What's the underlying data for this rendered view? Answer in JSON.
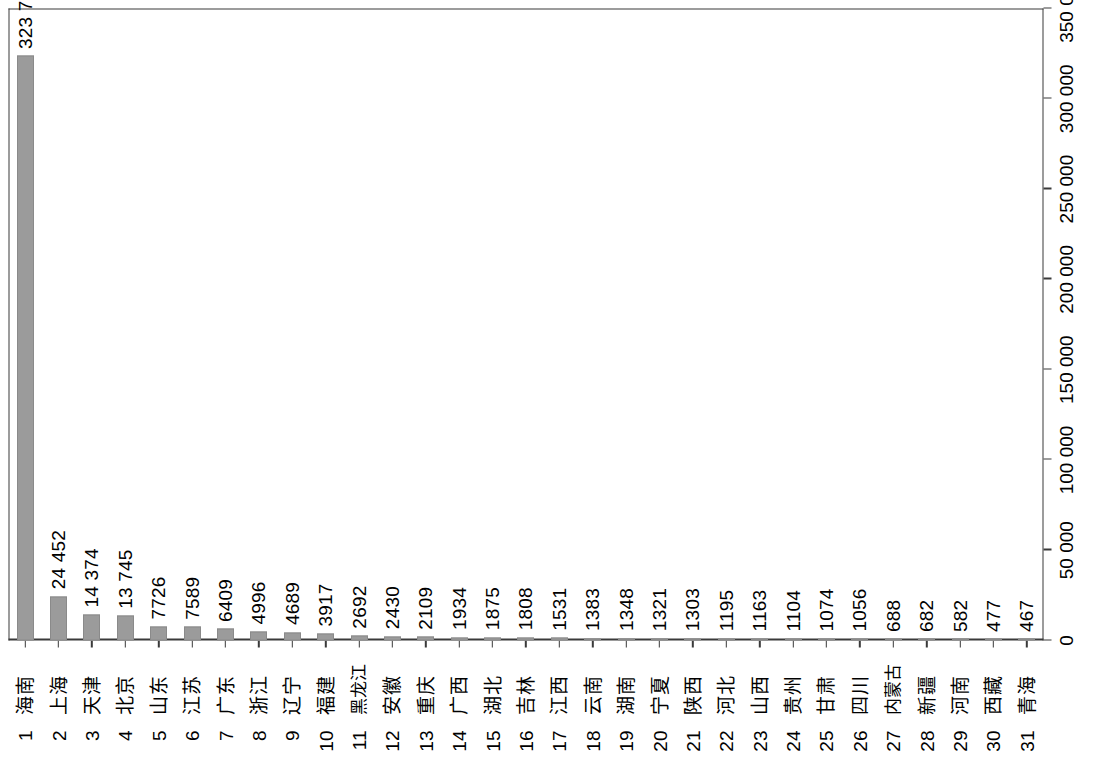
{
  "chart_data": {
    "type": "bar",
    "orientation": "horizontal",
    "title": "",
    "subtitle": "",
    "xlabel": "",
    "ylabel": "",
    "grid": false,
    "legend": null,
    "xlim": [
      0,
      350000
    ],
    "axis_tick_labels": [
      "0",
      "50 000",
      "100 000",
      "150 000",
      "200 000",
      "250 000",
      "300 000",
      "350 000"
    ],
    "axis_tick_values": [
      0,
      50000,
      100000,
      150000,
      200000,
      250000,
      300000,
      350000
    ],
    "axis_last_label_clipped": true,
    "bar_color": "#9b9b9b",
    "frame_color": "#3a3a3a",
    "ranks": [
      1,
      2,
      3,
      4,
      5,
      6,
      7,
      8,
      9,
      10,
      11,
      12,
      13,
      14,
      15,
      16,
      17,
      18,
      19,
      20,
      21,
      22,
      23,
      24,
      25,
      26,
      27,
      28,
      29,
      30,
      31
    ],
    "categories": [
      "海南",
      "上海",
      "天津",
      "北京",
      "山东",
      "江苏",
      "广东",
      "浙江",
      "辽宁",
      "福建",
      "黑龙江",
      "安徽",
      "重庆",
      "广西",
      "湖北",
      "吉林",
      "江西",
      "云南",
      "湖南",
      "宁夏",
      "陕西",
      "河北",
      "山西",
      "贵州",
      "甘肃",
      "四川",
      "内蒙古",
      "新疆",
      "河南",
      "西藏",
      "青海"
    ],
    "values": [
      323720,
      24452,
      14374,
      13745,
      7726,
      7589,
      6409,
      4996,
      4689,
      3917,
      2692,
      2430,
      2109,
      1934,
      1875,
      1808,
      1531,
      1383,
      1348,
      1321,
      1303,
      1195,
      1163,
      1104,
      1074,
      1056,
      688,
      682,
      582,
      477,
      467
    ],
    "value_labels": [
      "323 720",
      "24 452",
      "14 374",
      "13 745",
      "7726",
      "7589",
      "6409",
      "4996",
      "4689",
      "3917",
      "2692",
      "2430",
      "2109",
      "1934",
      "1875",
      "1808",
      "1531",
      "1383",
      "1348",
      "1321",
      "1303",
      "1195",
      "1163",
      "1104",
      "1074",
      "1056",
      "688",
      "682",
      "582",
      "477",
      "467"
    ]
  }
}
